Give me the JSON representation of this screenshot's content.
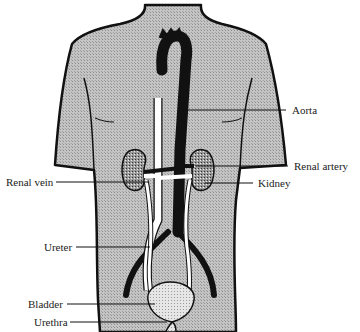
{
  "diagram": {
    "labels": {
      "aorta": "Aorta",
      "renal_artery": "Renal artery",
      "renal_vein": "Renal vein",
      "kidney": "Kidney",
      "ureter": "Ureter",
      "bladder": "Bladder",
      "urethra": "Urethra"
    },
    "colors": {
      "body_fill": "#b8b8b8",
      "outline": "#111111",
      "aorta": "#111111",
      "vena_cava": "#ffffff",
      "kidney": "#8a8a8a",
      "bladder": "#dcdcdc"
    }
  }
}
